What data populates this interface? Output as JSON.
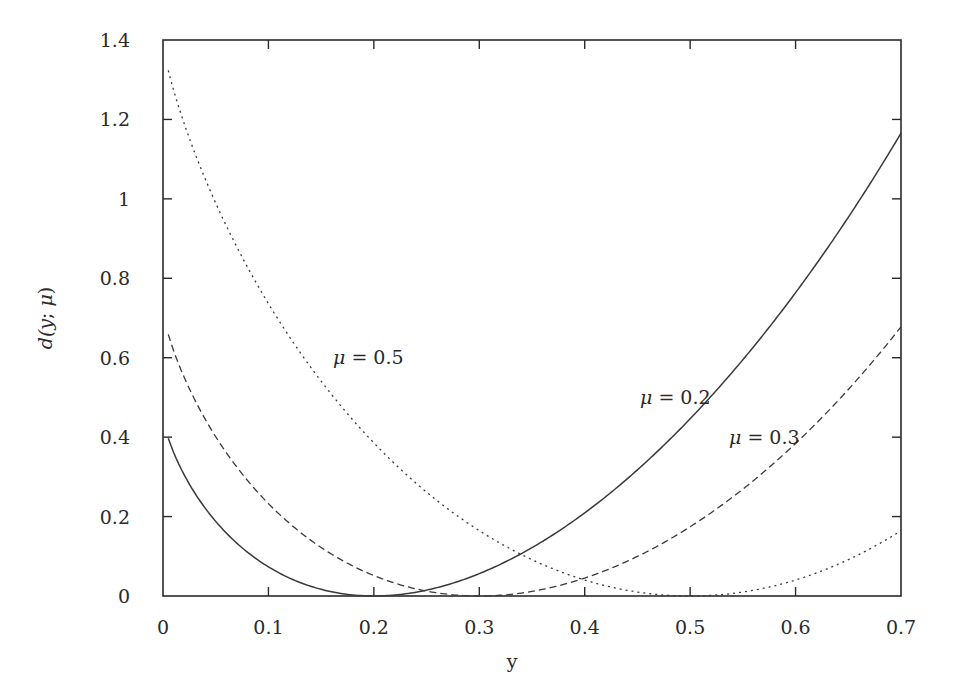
{
  "chart_data": {
    "type": "line",
    "title": "",
    "xlabel": "y",
    "ylabel": "d(y; μ)",
    "xlim": [
      0,
      0.7
    ],
    "ylim": [
      0,
      1.4
    ],
    "grid": false,
    "legend": "none (inline curve annotations)",
    "xticks": [
      "0",
      "0.1",
      "0.2",
      "0.3",
      "0.4",
      "0.5",
      "0.6",
      "0.7"
    ],
    "xtick_values": [
      0,
      0.1,
      0.2,
      0.3,
      0.4,
      0.5,
      0.6,
      0.7
    ],
    "yticks": [
      "0",
      "0.2",
      "0.4",
      "0.6",
      "0.8",
      "1",
      "1.2",
      "1.4"
    ],
    "ytick_values": [
      0,
      0.2,
      0.4,
      0.6,
      0.8,
      1.0,
      1.2,
      1.4
    ],
    "x": [
      0.005,
      0.05,
      0.1,
      0.15,
      0.2,
      0.25,
      0.3,
      0.35,
      0.4,
      0.45,
      0.5,
      0.55,
      0.6,
      0.65,
      0.7
    ],
    "series": [
      {
        "name": "μ = 0.2",
        "style": "solid",
        "values": [
          0.397,
          0.188,
          0.073,
          0.017,
          0.0,
          0.015,
          0.056,
          0.122,
          0.209,
          0.318,
          0.446,
          0.595,
          0.764,
          0.954,
          1.166
        ]
      },
      {
        "name": "μ = 0.3",
        "style": "dashed",
        "values": [
          0.659,
          0.401,
          0.233,
          0.122,
          0.052,
          0.012,
          0.0,
          0.012,
          0.045,
          0.1,
          0.174,
          0.269,
          0.384,
          0.52,
          0.678
        ]
      },
      {
        "name": "μ = 0.5",
        "style": "dotted",
        "values": [
          1.324,
          0.989,
          0.736,
          0.541,
          0.386,
          0.262,
          0.165,
          0.091,
          0.04,
          0.01,
          0.0,
          0.01,
          0.04,
          0.091,
          0.165
        ]
      }
    ],
    "annotations": [
      {
        "text": "μ = 0.5",
        "x": 0.16,
        "y": 0.6
      },
      {
        "text": "μ = 0.2",
        "x": 0.45,
        "y": 0.5
      },
      {
        "text": "μ = 0.3",
        "x": 0.535,
        "y": 0.4
      }
    ]
  },
  "labels": {
    "xlabel": "y",
    "ylabel_d": "d(",
    "ylabel_y": "y",
    "ylabel_sep": "; ",
    "ylabel_mu": "μ",
    "ylabel_close": ")",
    "annot_0_mu": "μ",
    "annot_0_rest": " = 0.5",
    "annot_1_mu": "μ",
    "annot_1_rest": " = 0.2",
    "annot_2_mu": "μ",
    "annot_2_rest": " = 0.3"
  },
  "colors": {
    "line": "#3a3a3a",
    "axis": "#2a2a2a",
    "background": "#ffffff"
  }
}
